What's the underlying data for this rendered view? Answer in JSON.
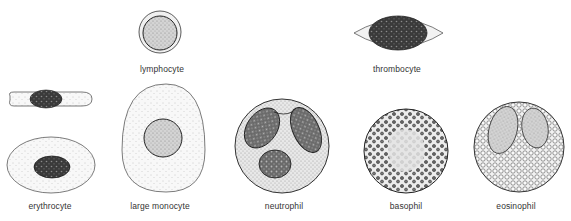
{
  "figure": {
    "cells": [
      {
        "id": "lymphocyte",
        "label": "lymphocyte"
      },
      {
        "id": "thrombocyte",
        "label": "thrombocyte"
      },
      {
        "id": "erythrocyte",
        "label": "erythrocyte"
      },
      {
        "id": "large-monocyte",
        "label": "large monocyte"
      },
      {
        "id": "neutrophil",
        "label": "neutrophil"
      },
      {
        "id": "basophil",
        "label": "basophil"
      },
      {
        "id": "eosinophil",
        "label": "eosinophil"
      }
    ],
    "colors": {
      "outline": "#333333",
      "nucleus_dark": "#2a2a2a",
      "stipple": "#bdbdbd",
      "background": "#ffffff"
    }
  }
}
